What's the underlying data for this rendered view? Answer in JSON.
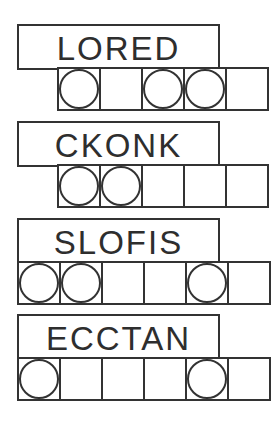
{
  "puzzles": [
    {
      "scrambled": "LORED",
      "answer_cells": 5,
      "circled": [
        true,
        false,
        true,
        true,
        false
      ],
      "top": 24,
      "cells_left": 57
    },
    {
      "scrambled": "CKONK",
      "answer_cells": 5,
      "circled": [
        true,
        true,
        false,
        false,
        false
      ],
      "top": 121,
      "cells_left": 57
    },
    {
      "scrambled": "SLOFIS",
      "answer_cells": 6,
      "circled": [
        true,
        true,
        false,
        false,
        true,
        false
      ],
      "top": 218,
      "cells_left": 17
    },
    {
      "scrambled": "ECCTAN",
      "answer_cells": 6,
      "circled": [
        true,
        false,
        false,
        false,
        true,
        false
      ],
      "top": 314,
      "cells_left": 17
    }
  ],
  "colors": {
    "ink": "#333333",
    "background": "#ffffff"
  }
}
